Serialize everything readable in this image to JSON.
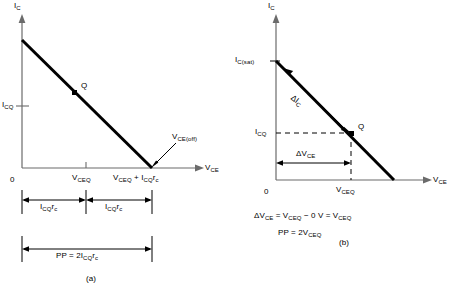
{
  "figure": {
    "caption_a": "(a)",
    "caption_b": "(b)"
  },
  "panel_a": {
    "y_axis_label": "I",
    "y_axis_sub": "C",
    "x_axis_label": "V",
    "x_axis_sub": "CE",
    "origin_label": "0",
    "icq_label": "I",
    "icq_sub": "CQ",
    "q_point_label": "Q",
    "vceq_label": "V",
    "vceq_sub": "CEQ",
    "vce_off_label": "V",
    "vce_off_sub": "CE(off)",
    "x_intercept_label": "V",
    "x_intercept_sub": "CEQ",
    "x_intercept_rest": " + I",
    "x_intercept_sub2": "CQ",
    "x_intercept_rest2": "r",
    "x_intercept_sub3": "c",
    "bracket_left_label": "I",
    "bracket_left_sub": "CQ",
    "bracket_left_rest": "r",
    "bracket_left_sub2": "c",
    "bracket_right_label": "I",
    "bracket_right_sub": "CQ",
    "bracket_right_rest": "r",
    "bracket_right_sub2": "c",
    "pp_label": "PP  =  2I",
    "pp_sub": "CQ",
    "pp_rest": "r",
    "pp_sub2": "c"
  },
  "panel_b": {
    "y_axis_label": "I",
    "y_axis_sub": "C",
    "x_axis_label": "V",
    "x_axis_sub": "CE",
    "origin_label": "0",
    "ic_sat_label": "I",
    "ic_sat_sub": "C(sat)",
    "icq_label": "I",
    "icq_sub": "CQ",
    "q_point_label": "Q",
    "delta_ic_label": "ΔI",
    "delta_ic_sub": "C",
    "delta_vce_label": "ΔV",
    "delta_vce_sub": "CE",
    "vceq_label": "V",
    "vceq_sub": "CEQ",
    "equation1_p1": "ΔV",
    "equation1_s1": "CE",
    "equation1_p2": "  =  V",
    "equation1_s2": "CEQ",
    "equation1_p3": "  −  0 V  =  V",
    "equation1_s3": "CEQ",
    "equation2_p1": "PP  =  2V",
    "equation2_s1": "CEQ"
  },
  "colors": {
    "axis": "#6b6b6b",
    "line": "#000000",
    "text": "#000000"
  }
}
